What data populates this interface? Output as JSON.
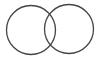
{
  "diagram": {
    "type": "venn",
    "sets": [
      {
        "name": "set-a",
        "label": ""
      },
      {
        "name": "set-b",
        "label": ""
      }
    ],
    "stroke_color": "#444444",
    "background": "#ffffff"
  }
}
